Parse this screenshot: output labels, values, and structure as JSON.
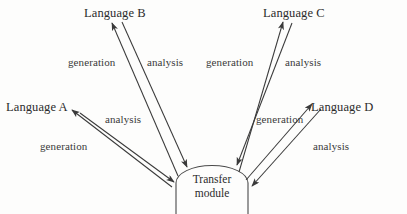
{
  "figure": {
    "type": "transfer-architecture-diagram",
    "background_color": "#fdfdfc",
    "stroke_color": "#3a3a3a",
    "hub": {
      "line1": "Transfer",
      "line2": "module"
    },
    "nodes": [
      {
        "id": "language-a",
        "label": "Language A",
        "x": 6,
        "y": 100
      },
      {
        "id": "language-b",
        "label": "Language B",
        "x": 84,
        "y": 6
      },
      {
        "id": "language-c",
        "label": "Language C",
        "x": 263,
        "y": 6
      },
      {
        "id": "language-d",
        "label": "Language D",
        "x": 311,
        "y": 100
      }
    ],
    "edge_labels": [
      {
        "id": "gen-a",
        "text": "generation",
        "x": 40,
        "y": 140
      },
      {
        "id": "ana-a",
        "text": "analysis",
        "x": 105,
        "y": 113
      },
      {
        "id": "gen-b",
        "text": "generation",
        "x": 68,
        "y": 56
      },
      {
        "id": "ana-b",
        "text": "analysis",
        "x": 147,
        "y": 56
      },
      {
        "id": "gen-c",
        "text": "generation",
        "x": 206,
        "y": 56
      },
      {
        "id": "ana-c",
        "text": "analysis",
        "x": 285,
        "y": 56
      },
      {
        "id": "gen-d",
        "text": "generation",
        "x": 256,
        "y": 113
      },
      {
        "id": "ana-d",
        "text": "analysis",
        "x": 313,
        "y": 140
      }
    ]
  }
}
